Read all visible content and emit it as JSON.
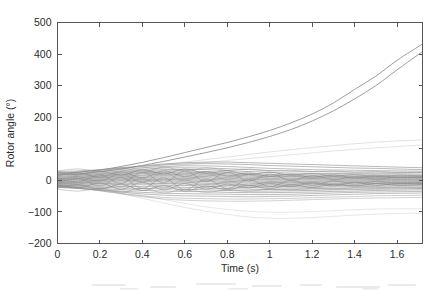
{
  "figure": {
    "background_color": "#ffffff",
    "axis_color": "#555555",
    "text_color": "#2b2b2b",
    "trace_color": "#8a8a8a",
    "width": 436,
    "height": 290
  },
  "chart_data": {
    "type": "line",
    "title": "",
    "subtitle": "",
    "xlabel": "Time (s)",
    "ylabel": "Rotor angle (°)",
    "xlim": [
      0,
      1.72
    ],
    "ylim": [
      -200,
      500
    ],
    "xticks": [
      0,
      0.2,
      0.4,
      0.6,
      0.8,
      1,
      1.2,
      1.4,
      1.6
    ],
    "xtick_labels": [
      "0",
      "0.2",
      "0.4",
      "0.6",
      "0.8",
      "1",
      "1.2",
      "1.4",
      "1.6"
    ],
    "yticks": [
      -200,
      -100,
      0,
      100,
      200,
      300,
      400,
      500
    ],
    "ytick_labels": [
      "-200",
      "-100",
      "0",
      "100",
      "200",
      "300",
      "400",
      "500"
    ],
    "grid": false,
    "legend": null,
    "legend_position": "none",
    "annotations": [],
    "x": [
      0,
      0.1,
      0.2,
      0.3,
      0.4,
      0.5,
      0.6,
      0.7,
      0.8,
      0.9,
      1.0,
      1.1,
      1.2,
      1.3,
      1.4,
      1.5,
      1.6,
      1.72
    ],
    "series": [
      {
        "name": "gen-01-unstable",
        "unstable": true,
        "width": 0.9,
        "opacity": 0.92,
        "values": [
          22,
          26,
          33,
          44,
          57,
          72,
          88,
          104,
          120,
          138,
          158,
          182,
          210,
          245,
          288,
          330,
          380,
          432
        ]
      },
      {
        "name": "gen-02-unstable",
        "unstable": true,
        "width": 0.9,
        "opacity": 0.92,
        "values": [
          18,
          21,
          27,
          36,
          47,
          60,
          74,
          88,
          103,
          120,
          139,
          161,
          188,
          220,
          258,
          300,
          350,
          408
        ]
      },
      {
        "name": "gen-03-drift-high",
        "unstable": false,
        "width": 0.6,
        "opacity": 0.42,
        "values": [
          14,
          17,
          22,
          30,
          39,
          49,
          58,
          66,
          74,
          82,
          90,
          97,
          104,
          110,
          116,
          121,
          125,
          128
        ]
      },
      {
        "name": "gen-04-drift-high",
        "unstable": false,
        "width": 0.6,
        "opacity": 0.38,
        "values": [
          10,
          13,
          18,
          25,
          33,
          42,
          50,
          57,
          63,
          69,
          75,
          81,
          87,
          93,
          98,
          103,
          107,
          112
        ]
      },
      {
        "name": "gen-05-low-drift",
        "unstable": false,
        "width": 0.6,
        "opacity": 0.35,
        "values": [
          -12,
          -18,
          -28,
          -42,
          -57,
          -72,
          -86,
          -98,
          -108,
          -116,
          -120,
          -120,
          -118,
          -114,
          -110,
          -107,
          -105,
          -104
        ]
      },
      {
        "name": "gen-06-low-drift",
        "unstable": false,
        "width": 0.6,
        "opacity": 0.33,
        "values": [
          -8,
          -14,
          -23,
          -35,
          -48,
          -61,
          -73,
          -84,
          -92,
          -98,
          -101,
          -101,
          -99,
          -96,
          -93,
          -91,
          -90,
          -90
        ]
      },
      {
        "name": "gen-07",
        "unstable": false,
        "width": 0.8,
        "opacity": 0.75,
        "values": [
          28,
          30,
          34,
          40,
          46,
          52,
          56,
          58,
          58,
          56,
          54,
          52,
          50,
          48,
          46,
          44,
          42,
          40
        ]
      },
      {
        "name": "gen-08",
        "unstable": false,
        "width": 0.8,
        "opacity": 0.75,
        "values": [
          24,
          27,
          32,
          38,
          44,
          49,
          52,
          53,
          52,
          50,
          47,
          45,
          43,
          41,
          39,
          38,
          36,
          34
        ]
      },
      {
        "name": "gen-09",
        "unstable": false,
        "width": 0.8,
        "opacity": 0.7,
        "values": [
          20,
          23,
          28,
          34,
          40,
          44,
          46,
          46,
          44,
          41,
          38,
          36,
          34,
          33,
          32,
          31,
          30,
          29
        ]
      },
      {
        "name": "gen-10",
        "unstable": false,
        "width": 0.8,
        "opacity": 0.7,
        "values": [
          16,
          19,
          24,
          30,
          35,
          39,
          40,
          39,
          37,
          34,
          31,
          29,
          28,
          27,
          26,
          26,
          25,
          25
        ]
      },
      {
        "name": "gen-11",
        "unstable": false,
        "width": 0.8,
        "opacity": 0.8,
        "values": [
          12,
          16,
          21,
          26,
          31,
          34,
          35,
          34,
          31,
          28,
          25,
          23,
          22,
          22,
          21,
          21,
          21,
          20
        ]
      },
      {
        "name": "gen-12",
        "unstable": false,
        "width": 0.8,
        "opacity": 0.8,
        "values": [
          9,
          13,
          18,
          23,
          27,
          30,
          30,
          28,
          25,
          22,
          19,
          18,
          17,
          17,
          17,
          17,
          17,
          16
        ]
      },
      {
        "name": "gen-13",
        "unstable": false,
        "width": 0.8,
        "opacity": 0.85,
        "values": [
          6,
          10,
          15,
          20,
          24,
          26,
          26,
          24,
          21,
          18,
          15,
          14,
          13,
          13,
          13,
          13,
          13,
          13
        ]
      },
      {
        "name": "gen-14",
        "unstable": false,
        "width": 0.8,
        "opacity": 0.85,
        "values": [
          4,
          8,
          13,
          17,
          21,
          23,
          22,
          20,
          17,
          14,
          12,
          11,
          10,
          10,
          10,
          10,
          10,
          10
        ]
      },
      {
        "name": "gen-15",
        "unstable": false,
        "width": 0.8,
        "opacity": 0.85,
        "values": [
          2,
          6,
          10,
          14,
          17,
          19,
          18,
          16,
          13,
          10,
          8,
          7,
          7,
          7,
          7,
          7,
          7,
          7
        ]
      },
      {
        "name": "gen-16",
        "unstable": false,
        "width": 0.8,
        "opacity": 0.85,
        "values": [
          0,
          4,
          8,
          11,
          14,
          15,
          14,
          12,
          9,
          6,
          4,
          4,
          4,
          4,
          4,
          4,
          4,
          4
        ]
      },
      {
        "name": "gen-17",
        "unstable": false,
        "width": 0.8,
        "opacity": 0.85,
        "values": [
          -2,
          2,
          5,
          8,
          10,
          11,
          10,
          8,
          5,
          3,
          1,
          1,
          1,
          1,
          1,
          2,
          2,
          2
        ]
      },
      {
        "name": "gen-18",
        "unstable": false,
        "width": 0.8,
        "opacity": 0.85,
        "values": [
          -4,
          -1,
          2,
          5,
          7,
          7,
          6,
          4,
          1,
          -1,
          -3,
          -3,
          -3,
          -2,
          -2,
          -1,
          -1,
          -1
        ]
      },
      {
        "name": "gen-19",
        "unstable": false,
        "width": 0.8,
        "opacity": 0.85,
        "values": [
          -6,
          -3,
          0,
          2,
          3,
          3,
          2,
          0,
          -3,
          -5,
          -7,
          -7,
          -6,
          -5,
          -5,
          -4,
          -4,
          -4
        ]
      },
      {
        "name": "gen-20",
        "unstable": false,
        "width": 0.8,
        "opacity": 0.85,
        "values": [
          -8,
          -6,
          -3,
          -1,
          0,
          -1,
          -2,
          -4,
          -7,
          -9,
          -11,
          -11,
          -10,
          -9,
          -8,
          -8,
          -7,
          -7
        ]
      },
      {
        "name": "gen-21",
        "unstable": false,
        "width": 0.8,
        "opacity": 0.85,
        "values": [
          -10,
          -8,
          -6,
          -5,
          -4,
          -5,
          -6,
          -9,
          -11,
          -14,
          -15,
          -15,
          -14,
          -13,
          -12,
          -11,
          -11,
          -10
        ]
      },
      {
        "name": "gen-22",
        "unstable": false,
        "width": 0.8,
        "opacity": 0.85,
        "values": [
          -12,
          -11,
          -10,
          -9,
          -9,
          -10,
          -11,
          -13,
          -16,
          -18,
          -19,
          -19,
          -18,
          -17,
          -16,
          -15,
          -14,
          -14
        ]
      },
      {
        "name": "gen-23",
        "unstable": false,
        "width": 0.8,
        "opacity": 0.8,
        "values": [
          -14,
          -14,
          -14,
          -14,
          -14,
          -15,
          -16,
          -18,
          -21,
          -23,
          -24,
          -24,
          -23,
          -21,
          -20,
          -19,
          -18,
          -18
        ]
      },
      {
        "name": "gen-24",
        "unstable": false,
        "width": 0.8,
        "opacity": 0.8,
        "values": [
          -16,
          -17,
          -18,
          -19,
          -20,
          -21,
          -22,
          -24,
          -26,
          -28,
          -29,
          -28,
          -27,
          -26,
          -24,
          -23,
          -22,
          -22
        ]
      },
      {
        "name": "gen-25",
        "unstable": false,
        "width": 0.8,
        "opacity": 0.78,
        "values": [
          -18,
          -20,
          -22,
          -24,
          -26,
          -27,
          -28,
          -30,
          -32,
          -34,
          -34,
          -33,
          -32,
          -30,
          -29,
          -28,
          -27,
          -26
        ]
      },
      {
        "name": "gen-26",
        "unstable": false,
        "width": 0.8,
        "opacity": 0.75,
        "values": [
          -20,
          -23,
          -26,
          -29,
          -32,
          -34,
          -35,
          -36,
          -38,
          -39,
          -39,
          -38,
          -37,
          -35,
          -34,
          -32,
          -31,
          -30
        ]
      },
      {
        "name": "gen-27",
        "unstable": false,
        "width": 0.8,
        "opacity": 0.72,
        "values": [
          -22,
          -26,
          -30,
          -34,
          -38,
          -41,
          -42,
          -43,
          -44,
          -45,
          -45,
          -44,
          -42,
          -40,
          -38,
          -37,
          -36,
          -35
        ]
      },
      {
        "name": "gen-28",
        "unstable": false,
        "width": 0.8,
        "opacity": 0.7,
        "values": [
          -20,
          -25,
          -31,
          -37,
          -43,
          -47,
          -49,
          -50,
          -51,
          -52,
          -51,
          -50,
          -48,
          -46,
          -44,
          -42,
          -41,
          -40
        ]
      },
      {
        "name": "gen-29",
        "unstable": false,
        "width": 0.7,
        "opacity": 0.6,
        "values": [
          -18,
          -25,
          -33,
          -41,
          -49,
          -54,
          -57,
          -58,
          -59,
          -59,
          -58,
          -57,
          -55,
          -53,
          -51,
          -49,
          -48,
          -47
        ]
      },
      {
        "name": "gen-30",
        "unstable": false,
        "width": 0.7,
        "opacity": 0.55,
        "values": [
          -15,
          -23,
          -33,
          -43,
          -52,
          -59,
          -63,
          -65,
          -66,
          -66,
          -65,
          -63,
          -61,
          -59,
          -57,
          -56,
          -55,
          -54
        ]
      },
      {
        "name": "gen-31-osc",
        "unstable": false,
        "width": 0.8,
        "opacity": 0.8,
        "values": [
          26,
          18,
          30,
          16,
          34,
          20,
          36,
          22,
          30,
          18,
          26,
          16,
          22,
          14,
          18,
          12,
          16,
          14
        ]
      },
      {
        "name": "gen-32-osc",
        "unstable": false,
        "width": 0.8,
        "opacity": 0.8,
        "values": [
          -24,
          -14,
          -28,
          -12,
          -32,
          -16,
          -34,
          -18,
          -30,
          -16,
          -26,
          -14,
          -22,
          -12,
          -18,
          -10,
          -16,
          -14
        ]
      },
      {
        "name": "gen-33-osc",
        "unstable": false,
        "width": 0.8,
        "opacity": 0.75,
        "values": [
          14,
          24,
          10,
          28,
          8,
          30,
          12,
          28,
          14,
          24,
          12,
          20,
          10,
          18,
          8,
          16,
          10,
          12
        ]
      },
      {
        "name": "gen-34-osc",
        "unstable": false,
        "width": 0.8,
        "opacity": 0.75,
        "values": [
          -14,
          -24,
          -8,
          -28,
          -6,
          -30,
          -10,
          -28,
          -12,
          -24,
          -10,
          -20,
          -8,
          -18,
          -6,
          -16,
          -10,
          -12
        ]
      },
      {
        "name": "gen-35-osc",
        "unstable": false,
        "width": 0.8,
        "opacity": 0.7,
        "values": [
          8,
          -6,
          18,
          -10,
          26,
          -8,
          30,
          -4,
          26,
          -2,
          20,
          0,
          16,
          2,
          12,
          4,
          10,
          8
        ]
      },
      {
        "name": "gen-36-osc",
        "unstable": false,
        "width": 0.8,
        "opacity": 0.7,
        "values": [
          -8,
          6,
          -18,
          10,
          -26,
          8,
          -30,
          4,
          -26,
          2,
          -20,
          0,
          -16,
          -2,
          -12,
          -4,
          -10,
          -8
        ]
      },
      {
        "name": "gen-37-osc",
        "unstable": false,
        "width": 0.7,
        "opacity": 0.6,
        "values": [
          30,
          36,
          28,
          40,
          26,
          42,
          30,
          40,
          32,
          36,
          30,
          32,
          28,
          30,
          26,
          28,
          26,
          26
        ]
      },
      {
        "name": "gen-38-osc",
        "unstable": false,
        "width": 0.7,
        "opacity": 0.6,
        "values": [
          -28,
          -34,
          -26,
          -38,
          -24,
          -40,
          -28,
          -38,
          -30,
          -34,
          -28,
          -30,
          -26,
          -28,
          -24,
          -26,
          -24,
          -24
        ]
      },
      {
        "name": "gen-39-osc",
        "unstable": false,
        "width": 0.7,
        "opacity": 0.55,
        "values": [
          4,
          12,
          -2,
          20,
          -6,
          24,
          -2,
          22,
          2,
          18,
          4,
          14,
          6,
          12,
          6,
          10,
          8,
          8
        ]
      },
      {
        "name": "gen-40-osc",
        "unstable": false,
        "width": 0.7,
        "opacity": 0.55,
        "values": [
          -4,
          -12,
          2,
          -20,
          6,
          -24,
          2,
          -22,
          -2,
          -18,
          -4,
          -14,
          -6,
          -12,
          -6,
          -10,
          -8,
          -8
        ]
      }
    ]
  }
}
